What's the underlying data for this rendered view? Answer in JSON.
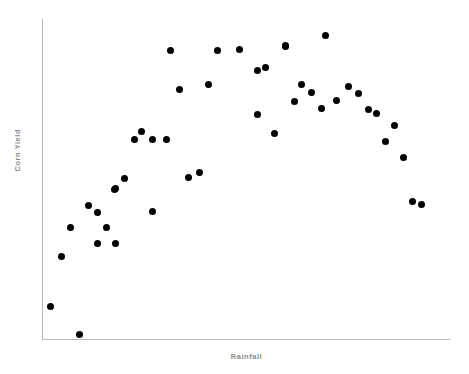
{
  "chart_data": {
    "type": "scatter",
    "title": "",
    "xlabel": "Rainfall",
    "ylabel": "Corn Yield",
    "grid": false,
    "legend": null,
    "xlim": [
      0,
      100
    ],
    "ylim": [
      0,
      100
    ],
    "marker": {
      "shape": "circle",
      "color": "#000000",
      "size_px": 7
    },
    "axis_color": "#b8b8b8",
    "label_color": "#8a8a8a",
    "x_tick_labels": [],
    "y_tick_labels": [],
    "points": [
      {
        "x": 2.0,
        "y": 10.3
      },
      {
        "x": 9.1,
        "y": 1.3
      },
      {
        "x": 4.7,
        "y": 25.9
      },
      {
        "x": 6.9,
        "y": 35.0
      },
      {
        "x": 11.3,
        "y": 41.6
      },
      {
        "x": 13.5,
        "y": 39.4
      },
      {
        "x": 15.7,
        "y": 35.0
      },
      {
        "x": 17.7,
        "y": 46.6
      },
      {
        "x": 13.5,
        "y": 30.0
      },
      {
        "x": 18.1,
        "y": 30.0
      },
      {
        "x": 22.6,
        "y": 62.5
      },
      {
        "x": 24.5,
        "y": 64.7
      },
      {
        "x": 27.2,
        "y": 62.2
      },
      {
        "x": 30.4,
        "y": 62.2
      },
      {
        "x": 20.3,
        "y": 50.3
      },
      {
        "x": 18.1,
        "y": 46.9
      },
      {
        "x": 36.0,
        "y": 50.6
      },
      {
        "x": 38.5,
        "y": 51.9
      },
      {
        "x": 27.2,
        "y": 39.7
      },
      {
        "x": 31.6,
        "y": 90.3
      },
      {
        "x": 33.6,
        "y": 78.1
      },
      {
        "x": 40.7,
        "y": 79.4
      },
      {
        "x": 43.1,
        "y": 90.3
      },
      {
        "x": 48.3,
        "y": 90.6
      },
      {
        "x": 52.7,
        "y": 83.8
      },
      {
        "x": 54.7,
        "y": 85.0
      },
      {
        "x": 59.6,
        "y": 91.3
      },
      {
        "x": 52.7,
        "y": 70.3
      },
      {
        "x": 56.9,
        "y": 64.1
      },
      {
        "x": 69.6,
        "y": 94.7
      },
      {
        "x": 59.6,
        "y": 91.6
      },
      {
        "x": 63.5,
        "y": 79.4
      },
      {
        "x": 66.0,
        "y": 76.9
      },
      {
        "x": 61.8,
        "y": 74.1
      },
      {
        "x": 68.4,
        "y": 71.9
      },
      {
        "x": 75.0,
        "y": 78.8
      },
      {
        "x": 77.5,
        "y": 76.6
      },
      {
        "x": 72.3,
        "y": 74.4
      },
      {
        "x": 80.1,
        "y": 71.6
      },
      {
        "x": 81.9,
        "y": 70.6
      },
      {
        "x": 86.5,
        "y": 66.6
      },
      {
        "x": 84.1,
        "y": 61.6
      },
      {
        "x": 88.5,
        "y": 56.6
      },
      {
        "x": 90.7,
        "y": 43.1
      },
      {
        "x": 93.1,
        "y": 41.9
      }
    ]
  },
  "icons": {
    "axis_origin": "axis-corner"
  }
}
